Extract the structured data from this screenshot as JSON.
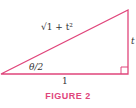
{
  "figure": {
    "caption": "FIGURE 2",
    "hypotenuse_label": "√1 + t²",
    "opposite_label": "t",
    "adjacent_label": "1",
    "angle_label": "θ/2",
    "colors": {
      "accent": "#e0457b",
      "text": "#333333"
    }
  }
}
